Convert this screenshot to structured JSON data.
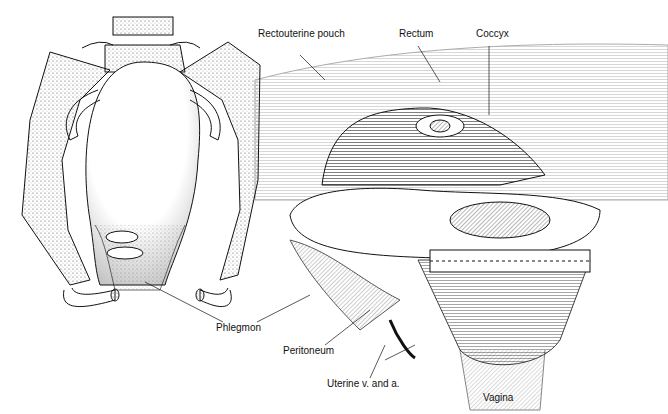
{
  "figure": {
    "left_panel": {
      "description": "Pelvis anterior view with uterus and phlegmon"
    },
    "right_panel": {
      "description": "Cross-section of pelvis showing rectouterine pouch, rectum, vagina"
    }
  },
  "labels": [
    {
      "id": "rectouterine-pouch",
      "text": "Rectouterine pouch",
      "x": 258,
      "y": 34
    },
    {
      "id": "rectum",
      "text": "Rectum",
      "x": 399,
      "y": 33
    },
    {
      "id": "coccyx",
      "text": "Coccyx",
      "x": 476,
      "y": 33
    },
    {
      "id": "phlegmon",
      "text": "Phlegmon",
      "x": 216,
      "y": 328
    },
    {
      "id": "peritoneum",
      "text": "Peritoneum",
      "x": 283,
      "y": 350
    },
    {
      "id": "uterine-vessels",
      "text": "Uterine v. and a.",
      "x": 327,
      "y": 383
    },
    {
      "id": "vagina",
      "text": "Vagina",
      "x": 483,
      "y": 394
    }
  ],
  "colors": {
    "ink": "#111111",
    "stipple": "#888888",
    "background": "#ffffff"
  }
}
